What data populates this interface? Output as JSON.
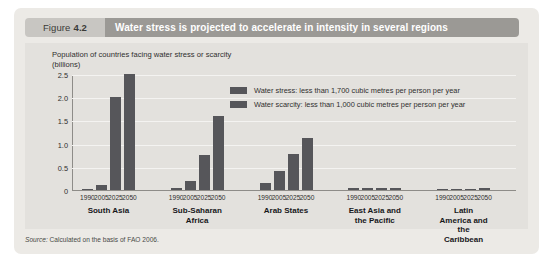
{
  "header": {
    "figure_label": "Figure",
    "figure_number": "4.2",
    "title": "Water stress is projected to accelerate in intensity in several regions"
  },
  "source": {
    "prefix": "Source:",
    "text": "Calculated on the basis of FAO 2006."
  },
  "chart_data": {
    "type": "bar",
    "title": "Population of countries facing water stress or scarcity\n(billions)",
    "xlabel": "",
    "ylabel": "Population of countries facing water stress or scarcity (billions)",
    "ylim": [
      0,
      2.5
    ],
    "yticks": [
      "0",
      "0.5",
      "1.0",
      "1.5",
      "2.0",
      "2.5"
    ],
    "ytick_values": [
      0,
      0.5,
      1.0,
      1.5,
      2.0,
      2.5
    ],
    "grid": true,
    "legend_position": "upper-center",
    "categories": [
      "1990",
      "2005",
      "2025",
      "2050"
    ],
    "groups": [
      {
        "name": "South Asia",
        "label": "South Asia",
        "values": [
          0.02,
          0.11,
          2.0,
          2.5
        ]
      },
      {
        "name": "Sub-Saharan Africa",
        "label": "Sub-Saharan\nAfrica",
        "values": [
          0.05,
          0.2,
          0.75,
          1.6
        ]
      },
      {
        "name": "Arab States",
        "label": "Arab States",
        "values": [
          0.15,
          0.4,
          0.78,
          1.12
        ]
      },
      {
        "name": "East Asia and the Pacific",
        "label": "East Asia and\nthe Pacific",
        "values": [
          0.04,
          0.04,
          0.04,
          0.05
        ]
      },
      {
        "name": "Latin America and the Caribbean",
        "label": "Latin America and\nthe Caribbean",
        "values": [
          0.0,
          0.0,
          0.0,
          0.04
        ]
      }
    ],
    "legend": [
      {
        "label": "Water stress: less than 1,700 cubic metres per person per year",
        "color": "#56565a"
      },
      {
        "label": "Water scarcity: less than 1,000 cubic metres per person per year",
        "color": "#56565a"
      }
    ],
    "colors": {
      "bar": "#56565a",
      "panel": "#e3e1dd",
      "card": "#eceae6",
      "title_bar": "#9b9995",
      "tag": "#c8c6c2",
      "gridline": "#f4f3f1",
      "axis": "#8e8c88"
    }
  }
}
